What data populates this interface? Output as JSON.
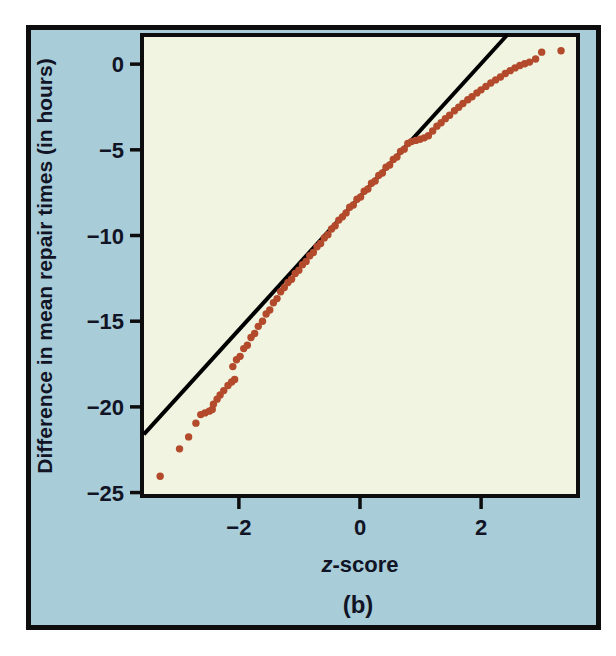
{
  "figure": {
    "caption": "(b)",
    "colors": {
      "page_background": "#ffffff",
      "panel": "#a8ccd8",
      "plot_background": "#f0f4e1",
      "frame": "#0d0d0d",
      "point": "#b34a2b",
      "fit_line": "#000000",
      "text": "#101425"
    }
  },
  "chart_data": {
    "type": "scatter",
    "title": "",
    "xlabel": "z-score",
    "xlabel_italic": "z",
    "xlabel_rest": "-score",
    "ylabel": "Difference in mean repair times (in hours)",
    "xlim": [
      -3.6,
      3.6
    ],
    "ylim": [
      -25.2,
      1.7
    ],
    "grid": false,
    "legend": "none",
    "xticks": [
      {
        "value": -2,
        "label": "−2"
      },
      {
        "value": 0,
        "label": "0"
      },
      {
        "value": 2,
        "label": "2"
      }
    ],
    "yticks": [
      {
        "value": 0,
        "label": "0"
      },
      {
        "value": -5,
        "label": "−5"
      },
      {
        "value": -10,
        "label": "−10"
      },
      {
        "value": -15,
        "label": "−15"
      },
      {
        "value": -20,
        "label": "−20"
      },
      {
        "value": -25,
        "label": "−25"
      }
    ],
    "fit_line": {
      "x1": -3.57,
      "y1": -21.6,
      "x2": 2.43,
      "y2": 1.7
    },
    "points": [
      [
        -3.3,
        -24.05
      ],
      [
        -2.98,
        -22.45
      ],
      [
        -2.83,
        -21.75
      ],
      [
        -2.71,
        -20.95
      ],
      [
        -2.63,
        -20.45
      ],
      [
        -2.56,
        -20.35
      ],
      [
        -2.49,
        -20.25
      ],
      [
        -2.44,
        -20.15
      ],
      [
        -2.42,
        -19.85
      ],
      [
        -2.36,
        -19.55
      ],
      [
        -2.31,
        -19.3
      ],
      [
        -2.25,
        -19.05
      ],
      [
        -2.18,
        -18.75
      ],
      [
        -2.12,
        -18.55
      ],
      [
        -2.07,
        -18.4
      ],
      [
        -2.1,
        -17.65
      ],
      [
        -2.04,
        -17.25
      ],
      [
        -1.98,
        -17.05
      ],
      [
        -1.92,
        -16.6
      ],
      [
        -1.86,
        -16.4
      ],
      [
        -1.8,
        -15.95
      ],
      [
        -1.74,
        -15.72
      ],
      [
        -1.68,
        -15.3
      ],
      [
        -1.61,
        -15.0
      ],
      [
        -1.55,
        -14.58
      ],
      [
        -1.49,
        -14.35
      ],
      [
        -1.43,
        -13.92
      ],
      [
        -1.37,
        -13.68
      ],
      [
        -1.31,
        -13.28
      ],
      [
        -1.25,
        -13.04
      ],
      [
        -1.19,
        -12.74
      ],
      [
        -1.13,
        -12.55
      ],
      [
        -1.07,
        -12.22
      ],
      [
        -1.01,
        -12.03
      ],
      [
        -0.95,
        -11.7
      ],
      [
        -0.89,
        -11.51
      ],
      [
        -0.83,
        -11.18
      ],
      [
        -0.77,
        -10.99
      ],
      [
        -0.71,
        -10.66
      ],
      [
        -0.65,
        -10.47
      ],
      [
        -0.59,
        -10.14
      ],
      [
        -0.53,
        -9.95
      ],
      [
        -0.47,
        -9.62
      ],
      [
        -0.41,
        -9.43
      ],
      [
        -0.35,
        -9.1
      ],
      [
        -0.29,
        -8.91
      ],
      [
        -0.23,
        -8.68
      ],
      [
        -0.17,
        -8.35
      ],
      [
        -0.11,
        -8.22
      ],
      [
        -0.05,
        -7.88
      ],
      [
        0.01,
        -7.75
      ],
      [
        0.07,
        -7.42
      ],
      [
        0.13,
        -7.29
      ],
      [
        0.19,
        -6.95
      ],
      [
        0.25,
        -6.82
      ],
      [
        0.31,
        -6.49
      ],
      [
        0.37,
        -6.35
      ],
      [
        0.43,
        -6.02
      ],
      [
        0.49,
        -5.89
      ],
      [
        0.55,
        -5.56
      ],
      [
        0.61,
        -5.42
      ],
      [
        0.67,
        -5.09
      ],
      [
        0.73,
        -4.96
      ],
      [
        0.79,
        -4.63
      ],
      [
        0.85,
        -4.52
      ],
      [
        0.92,
        -4.45
      ],
      [
        0.99,
        -4.38
      ],
      [
        1.06,
        -4.3
      ],
      [
        1.13,
        -4.18
      ],
      [
        1.2,
        -3.9
      ],
      [
        1.27,
        -3.62
      ],
      [
        1.34,
        -3.42
      ],
      [
        1.41,
        -3.18
      ],
      [
        1.48,
        -2.98
      ],
      [
        1.56,
        -2.72
      ],
      [
        1.63,
        -2.52
      ],
      [
        1.7,
        -2.3
      ],
      [
        1.78,
        -2.08
      ],
      [
        1.85,
        -1.9
      ],
      [
        1.93,
        -1.68
      ],
      [
        2.0,
        -1.5
      ],
      [
        2.08,
        -1.3
      ],
      [
        2.16,
        -1.1
      ],
      [
        2.24,
        -0.92
      ],
      [
        2.32,
        -0.75
      ],
      [
        2.4,
        -0.55
      ],
      [
        2.48,
        -0.38
      ],
      [
        2.56,
        -0.22
      ],
      [
        2.64,
        -0.08
      ],
      [
        2.72,
        0.02
      ],
      [
        2.8,
        0.12
      ],
      [
        2.9,
        0.3
      ],
      [
        3.0,
        0.7
      ],
      [
        3.32,
        0.78
      ]
    ]
  }
}
